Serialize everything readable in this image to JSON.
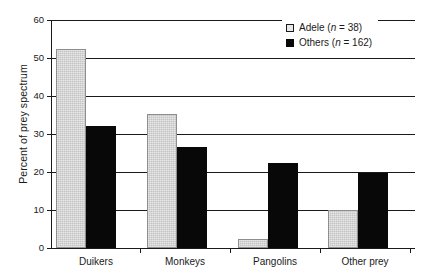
{
  "chart_data": {
    "type": "bar",
    "title": "",
    "xlabel": "",
    "ylabel": "Percent of prey spectrum",
    "categories": [
      "Duikers",
      "Monkeys",
      "Pangolins",
      "Other prey"
    ],
    "series": [
      {
        "name": "Adele",
        "n": 38,
        "legend_label": "Adele (n = 38)",
        "color": "#c3c3c3",
        "values": [
          52.5,
          35.2,
          2.5,
          10.1
        ]
      },
      {
        "name": "Others",
        "n": 162,
        "legend_label": "Others (n = 162)",
        "color": "#080808",
        "values": [
          32.2,
          26.6,
          22.3,
          19.8
        ]
      }
    ],
    "ylim": [
      0,
      60
    ],
    "ytick_values": [
      0,
      10,
      20,
      30,
      40,
      50,
      60
    ],
    "ytick_labels": [
      "0",
      "10",
      "20",
      "30",
      "40",
      "50",
      "60"
    ],
    "grid": true,
    "grid_axis": "y",
    "legend_position": "top-right"
  },
  "legend": {
    "entries": [
      {
        "name_text": "Adele ",
        "n_italic": "n",
        "n_rest": " = 38)",
        "open_paren": "(",
        "swatch": "open-square"
      },
      {
        "name_text": "Others ",
        "n_italic": "n",
        "n_rest": " = 162)",
        "open_paren": "(",
        "swatch": "filled-square"
      }
    ]
  },
  "axis": {
    "y_title": "Percent of prey spectrum"
  }
}
